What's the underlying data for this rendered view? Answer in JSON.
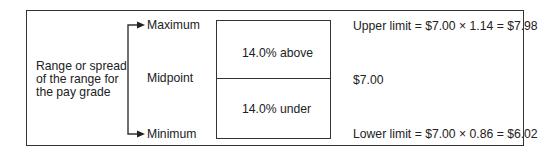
{
  "diagram": {
    "range_label": [
      "Range or spread",
      "of the range for",
      "the pay grade"
    ],
    "points": {
      "maximum": "Maximum",
      "midpoint": "Midpoint",
      "minimum": "Minimum"
    },
    "bands": {
      "above": "14.0% above",
      "under": "14.0% under"
    },
    "values": {
      "upper": "Upper limit = $7.00 × 1.14 = $7.98",
      "midpoint": "$7.00",
      "lower": "Lower limit = $7.00 × 0.86 = $6.02"
    },
    "colors": {
      "line": "#333333",
      "text": "#222222",
      "background": "#ffffff"
    }
  }
}
